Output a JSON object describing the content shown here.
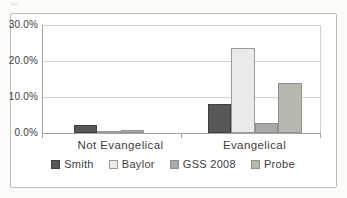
{
  "chart_data": {
    "type": "bar",
    "title": "",
    "xlabel": "",
    "ylabel": "",
    "categories": [
      "Not Evangelical",
      "Evangelical"
    ],
    "series": [
      {
        "name": "Smith",
        "values": [
          2.2,
          8.0
        ]
      },
      {
        "name": "Baylor",
        "values": [
          0.6,
          23.5
        ]
      },
      {
        "name": "GSS 2008",
        "values": [
          0.8,
          2.9
        ]
      },
      {
        "name": "Probe",
        "values": [
          0.0,
          14.0
        ]
      }
    ],
    "y_ticks": [
      "0.0%",
      "10.0%",
      "20.0%",
      "30.0%"
    ],
    "ylim": [
      0,
      30
    ],
    "grid": true,
    "legend_position": "bottom",
    "colors": {
      "Smith": {
        "fill": "#575757",
        "border": "#3f3f3f"
      },
      "Baylor": {
        "fill": "#eaeae8",
        "border": "#9b9b9b"
      },
      "GSS 2008": {
        "fill": "#a9a9a9",
        "border": "#8f8f8f"
      },
      "Probe": {
        "fill": "#b7b9b0",
        "border": "#8f918a"
      }
    }
  }
}
